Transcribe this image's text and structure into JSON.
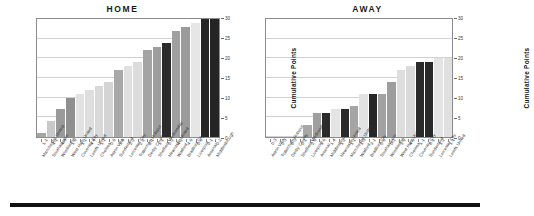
{
  "figure": {
    "bottom_rule": true
  },
  "axis": {
    "ylabel": "Cumulative Points",
    "ticks": [
      0,
      5,
      10,
      15,
      20,
      25,
      30
    ],
    "ymin": 0,
    "ymax": 30
  },
  "chart_data": [
    {
      "type": "bar",
      "title": "HOME",
      "xlabel": "",
      "ylabel": "Cumulative Points",
      "ylim": [
        0,
        30
      ],
      "grid": true,
      "categories": [
        "Manchester United",
        "Southampton",
        "Wimbledon",
        "West Ham United",
        "Coventry City",
        "Leeds United",
        "Chelsea",
        "Aston Villa",
        "Sunderland",
        "Leicester City",
        "Tottenham Hotspur",
        "Derby County",
        "Sheffield Wednesday",
        "Newcastle United",
        "Watford",
        "Bradford City",
        "Liverpool",
        "Arsenal",
        "Middlesbrough"
      ],
      "scores": [
        "1-1",
        "4-1",
        "4-0",
        "1-0",
        "1-1",
        "4-4",
        "1-1",
        "0-0",
        "5-0",
        "2-2",
        "2-2",
        "2-1",
        "1-1",
        "0-2",
        "4-2",
        "4-0",
        "0-0",
        "0-1",
        "0-2"
      ],
      "values": [
        1,
        4,
        7,
        10,
        11,
        12,
        13,
        14,
        17,
        18,
        19,
        22,
        23,
        24,
        27,
        28,
        29,
        30,
        30
      ],
      "bar_colors": [
        "#a6a6a6",
        "#c8c8c8",
        "#9a9a9a",
        "#8f8f8f",
        "#e2e2e2",
        "#dedede",
        "#d9d9d9",
        "#d4d4d4",
        "#a8a8a8",
        "#e0e0e0",
        "#dcdcdc",
        "#a4a4a4",
        "#9e9e9e",
        "#2b2b2b",
        "#a0a0a0",
        "#9b9b9b",
        "#e6e6e6",
        "#262626",
        "#242424"
      ]
    },
    {
      "type": "bar",
      "title": "AWAY",
      "xlabel": "",
      "ylabel": "Cumulative Points",
      "ylim": [
        0,
        30
      ],
      "grid": true,
      "categories": [
        "Aston Villa",
        "Tottenham Hotspur",
        "Derby County",
        "Sheffield Wednesday",
        "Liverpool",
        "Arsenal",
        "Middlesbrough",
        "Newcastle United",
        "Manchester United",
        "Watford",
        "Bradford City",
        "Southampton",
        "Wimbledon",
        "West Ham United",
        "Chelsea",
        "Coventry City",
        "Sunderland",
        "Leicester City",
        "Leeds United"
      ],
      "scores": [
        "0-3",
        "0-3",
        "0-3",
        "0-1",
        "2-0",
        "1-0",
        "1-4",
        "1-2",
        "1-1",
        "1-3",
        "3-1",
        "0-0",
        "0-2",
        "3-0",
        "4-0",
        "1-1",
        "0-1",
        "1-2",
        "1-1",
        "1-1"
      ],
      "values": [
        0,
        0,
        0,
        0,
        3,
        6,
        6,
        7,
        7,
        8,
        11,
        11,
        11,
        14,
        17,
        18,
        19,
        19,
        20,
        20
      ],
      "bar_colors": [
        "#e8e8e8",
        "#e8e8e8",
        "#e8e8e8",
        "#e8e8e8",
        "#a8a8a8",
        "#9f9f9f",
        "#2b2b2b",
        "#e4e4e4",
        "#2a2a2a",
        "#a5a5a5",
        "#e2e2e2",
        "#272727",
        "#a2a2a2",
        "#9d9d9d",
        "#dedede",
        "#dadada",
        "#2a2a2a",
        "#292929",
        "#e4e4e4",
        "#e0e0e0"
      ]
    }
  ]
}
